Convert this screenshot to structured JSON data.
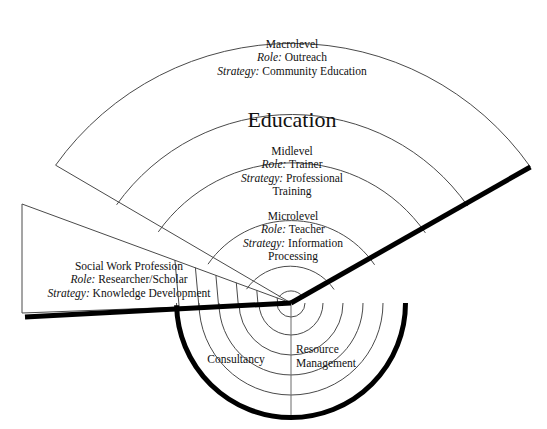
{
  "diagram": {
    "title_center": "Education",
    "geometry": {
      "center_x": 291,
      "center_y": 303,
      "radii": [
        15,
        53,
        101,
        163,
        215,
        291
      ],
      "lower_radii": [
        14,
        32,
        52,
        72,
        92,
        115
      ],
      "accent_color": "#000000",
      "line_color": "#4a4a4a",
      "bold_line_color": "#000000"
    },
    "sectors": [
      {
        "id": "macrolevel",
        "title": "Macrolevel",
        "role_label": "Role:",
        "role_value": "Outreach",
        "strategy_label": "Strategy:",
        "strategy_value": "Community Education"
      },
      {
        "id": "midlevel",
        "title": "Midlevel",
        "role_label": "Role:",
        "role_value": "Trainer",
        "strategy_label": "Strategy:",
        "strategy_value": "Professional",
        "strategy_value_2": "Training"
      },
      {
        "id": "microlevel",
        "title": "Microlevel",
        "role_label": "Role:",
        "role_value": "Teacher",
        "strategy_label": "Strategy:",
        "strategy_value": "Information",
        "strategy_value_2": "Processing"
      },
      {
        "id": "social-work-profession",
        "title": "Social Work Profession",
        "role_label": "Role:",
        "role_value": "Researcher/Scholar",
        "strategy_label": "Strategy:",
        "strategy_value": "Knowledge Development"
      }
    ],
    "lower_labels": [
      {
        "id": "consultancy",
        "text": "Consultancy"
      },
      {
        "id": "resource-management",
        "line1": "Resource",
        "line2": "Management"
      }
    ]
  }
}
